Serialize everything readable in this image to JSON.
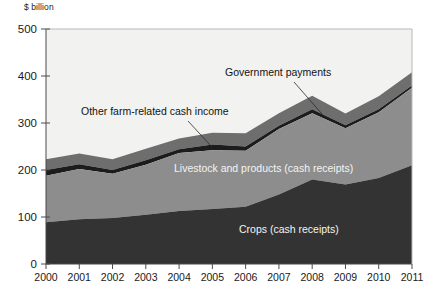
{
  "axis_unit": "$ billion",
  "annotations": {
    "government_payments": "Government payments",
    "other_farm_related": "Other farm-related cash income",
    "livestock": "Livestock and products (cash receipts)",
    "crops": "Crops (cash receipts)"
  },
  "colors": {
    "plot_background": "#f2f2f0",
    "crops": "#333333",
    "livestock": "#8d8d8d",
    "government": "#1c1c1c",
    "other_farm": "#6e6e6e",
    "axis": "#4a4a4a",
    "text_dark": "#121212",
    "text_light": "#f4f4f2"
  },
  "chart_data": {
    "type": "area",
    "title": "",
    "xlabel": "",
    "ylabel": "$ billion",
    "ylim": [
      0,
      500
    ],
    "yticks": [
      0,
      100,
      200,
      300,
      400,
      500
    ],
    "ytick_labels": [
      "0",
      "100",
      "200",
      "300",
      "400",
      "500"
    ],
    "grid": false,
    "legend_position": "inline-annotations",
    "stacked": true,
    "categories": [
      "2000",
      "2001",
      "2002",
      "2003",
      "2004",
      "2005",
      "2006",
      "2007",
      "2008",
      "2009",
      "2010",
      "2011"
    ],
    "x": [
      2000,
      2001,
      2002,
      2003,
      2004,
      2005,
      2006,
      2007,
      2008,
      2009,
      2010,
      2011
    ],
    "series": [
      {
        "name": "Crops (cash receipts)",
        "values": [
          89,
          95,
          98,
          105,
          113,
          117,
          122,
          148,
          180,
          169,
          183,
          210
        ]
      },
      {
        "name": "Livestock and products (cash receipts)",
        "values": [
          99,
          107,
          94,
          106,
          123,
          125,
          119,
          139,
          141,
          120,
          140,
          165
        ]
      },
      {
        "name": "Government payments",
        "values": [
          12,
          10,
          8,
          10,
          8,
          12,
          9,
          7,
          8,
          6,
          6,
          5
        ]
      },
      {
        "name": "Other farm-related cash income",
        "values": [
          23,
          23,
          23,
          24,
          23,
          25,
          28,
          27,
          29,
          25,
          28,
          28
        ]
      }
    ],
    "totals": [
      223,
      235,
      223,
      245,
      267,
      279,
      278,
      321,
      358,
      320,
      357,
      408
    ]
  }
}
